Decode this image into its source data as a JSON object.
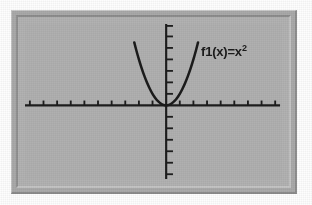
{
  "figure": {
    "kind": "graphing-calculator-screen",
    "background_color": "#ffffff",
    "frame_color": "#a9a9a9",
    "screen_color": "#b0b0b0",
    "ink_color": "#1b1b1b"
  },
  "label": {
    "name": "function-label",
    "full_text": "f1(x)=x²",
    "base_text": "f1(x)=x",
    "exponent_text": "2"
  },
  "chart_data": {
    "type": "line",
    "title": "",
    "subtitle": "",
    "xlabel": "",
    "ylabel": "",
    "grid": false,
    "legend_position": "inside-upper-right",
    "annotations": [
      {
        "text": "f1(x)=x²",
        "x": 1.9,
        "y": 5.4,
        "bold": true
      }
    ],
    "axes": {
      "x_axis_visible": true,
      "y_axis_visible": true,
      "x_tick_count_left": 9,
      "x_tick_count_right": 9,
      "y_tick_count_above": 6,
      "y_tick_count_below": 8,
      "tick_spacing_units": 1,
      "tick_labels_shown": false
    },
    "xlim": [
      -7.2,
      7.2
    ],
    "ylim": [
      -5.6,
      5.2
    ],
    "series": [
      {
        "name": "f1(x)=x²",
        "expression": "x^2",
        "color": "#1b1b1b",
        "line_width": 2,
        "x": [
          -2.34,
          -2.2,
          -2.0,
          -1.8,
          -1.6,
          -1.4,
          -1.2,
          -1.0,
          -0.8,
          -0.6,
          -0.4,
          -0.2,
          0.0,
          0.2,
          0.4,
          0.6,
          0.8,
          1.0,
          1.2,
          1.4,
          1.6,
          1.8,
          2.0,
          2.2,
          2.34
        ],
        "values": [
          5.48,
          4.84,
          4.0,
          3.24,
          2.56,
          1.96,
          1.44,
          1.0,
          0.64,
          0.36,
          0.16,
          0.04,
          0.0,
          0.04,
          0.16,
          0.36,
          0.64,
          1.0,
          1.44,
          1.96,
          2.56,
          3.24,
          4.0,
          4.84,
          5.48
        ]
      }
    ]
  }
}
